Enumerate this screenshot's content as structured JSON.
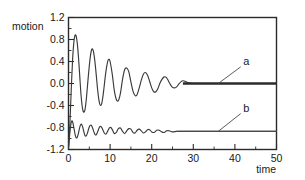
{
  "chart_data": {
    "type": "line",
    "title": "",
    "xlabel": "time",
    "ylabel": "motion",
    "xlim": [
      0,
      50
    ],
    "ylim": [
      -1.2,
      1.2
    ],
    "grid": false,
    "legend_position": "inline-annotations",
    "x_ticks": [
      0,
      10,
      20,
      30,
      40,
      50
    ],
    "x_tick_labels": [
      "0",
      "10",
      "20",
      "30",
      "40",
      "50"
    ],
    "x_minor_ticks": [
      5,
      15,
      25,
      35,
      45
    ],
    "y_ticks": [
      1.2,
      0.8,
      0.4,
      0.0,
      -0.4,
      -0.8,
      -1.2
    ],
    "y_tick_labels": [
      "1.2",
      "0.8",
      "0.4",
      "0.0",
      "-0.4",
      "-0.8",
      "-1.2"
    ],
    "y_minor_ticks": [
      1.0,
      0.6,
      0.2,
      -0.2,
      -0.6,
      -1.0
    ],
    "annotations": [
      {
        "text": "a",
        "x": 42.0,
        "y": 0.33,
        "points_to_x": 36.0,
        "points_to_y": 0.0
      },
      {
        "text": "b",
        "x": 42.0,
        "y": -0.52,
        "points_to_x": 36.0,
        "points_to_y": -0.87
      }
    ],
    "series": [
      {
        "name": "a",
        "label": "a",
        "steady_state": 0.0,
        "description": "underdamped oscillation settling to 0.0",
        "x": [
          0.0,
          0.25,
          0.5,
          0.75,
          1.0,
          1.25,
          1.5,
          1.75,
          2.0,
          2.25,
          2.5,
          2.75,
          3.0,
          3.25,
          3.5,
          3.75,
          4.0,
          4.25,
          4.5,
          4.75,
          5.0,
          5.25,
          5.5,
          5.75,
          6.0,
          6.25,
          6.5,
          6.75,
          7.0,
          7.25,
          7.5,
          7.75,
          8.0,
          8.25,
          8.5,
          8.75,
          9.0,
          9.25,
          9.5,
          9.75,
          10.0,
          10.5,
          11.0,
          11.5,
          12.0,
          12.5,
          13.0,
          13.5,
          14.0,
          14.5,
          15.0,
          15.5,
          16.0,
          16.5,
          17.0,
          17.5,
          18.0,
          18.5,
          19.0,
          19.5,
          20.0,
          20.5,
          21.0,
          21.5,
          22.0,
          22.5,
          23.0,
          23.5,
          24.0,
          24.5,
          25.0,
          25.5,
          26.0,
          26.5,
          27.0,
          27.5,
          28.0,
          29.0,
          31.0,
          34.0,
          38.0,
          44.0,
          50.0
        ],
        "y": [
          -1.18,
          -0.88,
          -0.42,
          0.05,
          0.46,
          0.72,
          0.86,
          0.88,
          0.8,
          0.62,
          0.37,
          0.08,
          -0.2,
          -0.39,
          -0.5,
          -0.52,
          -0.46,
          -0.31,
          -0.1,
          0.12,
          0.32,
          0.49,
          0.6,
          0.63,
          0.58,
          0.46,
          0.29,
          0.09,
          -0.11,
          -0.27,
          -0.37,
          -0.4,
          -0.36,
          -0.25,
          -0.1,
          0.07,
          0.22,
          0.34,
          0.42,
          0.44,
          0.4,
          0.18,
          -0.12,
          -0.29,
          -0.31,
          -0.17,
          0.08,
          0.25,
          0.28,
          0.21,
          0.03,
          -0.14,
          -0.22,
          -0.2,
          -0.08,
          0.06,
          0.17,
          0.2,
          0.15,
          0.04,
          -0.08,
          -0.15,
          -0.15,
          -0.09,
          0.01,
          0.08,
          0.12,
          0.11,
          0.05,
          -0.02,
          -0.07,
          -0.08,
          -0.06,
          -0.01,
          0.03,
          0.05,
          0.04,
          0.01,
          0.0,
          0.0,
          0.0,
          0.0,
          0.0
        ]
      },
      {
        "name": "b",
        "label": "b",
        "steady_state": -0.87,
        "description": "smaller-amplitude higher-frequency damped oscillation settling to -0.87",
        "x": [
          0.0,
          0.2,
          0.4,
          0.6,
          0.8,
          1.0,
          1.2,
          1.4,
          1.6,
          1.8,
          2.0,
          2.2,
          2.4,
          2.6,
          2.8,
          3.0,
          3.2,
          3.4,
          3.6,
          3.8,
          4.0,
          4.3,
          4.6,
          4.9,
          5.2,
          5.5,
          5.8,
          6.1,
          6.4,
          6.7,
          7.0,
          7.4,
          7.8,
          8.2,
          8.6,
          9.0,
          9.4,
          9.8,
          10.2,
          10.6,
          11.0,
          11.5,
          12.0,
          12.5,
          13.0,
          13.5,
          14.0,
          14.5,
          15.0,
          15.5,
          16.0,
          16.5,
          17.0,
          17.5,
          18.0,
          18.5,
          19.0,
          19.5,
          20.0,
          20.6,
          21.2,
          21.8,
          22.4,
          23.0,
          23.6,
          24.2,
          25.0,
          26.0,
          27.0,
          28.0,
          30.0,
          33.0,
          37.0,
          42.0,
          50.0
        ],
        "y": [
          -1.16,
          -1.0,
          -0.84,
          -0.73,
          -0.68,
          -0.7,
          -0.77,
          -0.85,
          -0.93,
          -0.98,
          -0.99,
          -0.96,
          -0.9,
          -0.83,
          -0.77,
          -0.74,
          -0.75,
          -0.79,
          -0.85,
          -0.91,
          -0.95,
          -0.95,
          -0.89,
          -0.81,
          -0.76,
          -0.76,
          -0.81,
          -0.88,
          -0.93,
          -0.93,
          -0.88,
          -0.8,
          -0.78,
          -0.83,
          -0.9,
          -0.92,
          -0.87,
          -0.81,
          -0.8,
          -0.85,
          -0.91,
          -0.89,
          -0.82,
          -0.81,
          -0.87,
          -0.91,
          -0.86,
          -0.82,
          -0.83,
          -0.89,
          -0.9,
          -0.85,
          -0.83,
          -0.86,
          -0.9,
          -0.88,
          -0.84,
          -0.84,
          -0.88,
          -0.89,
          -0.85,
          -0.85,
          -0.88,
          -0.89,
          -0.86,
          -0.86,
          -0.88,
          -0.87,
          -0.87,
          -0.87,
          -0.87,
          -0.87,
          -0.87,
          -0.87,
          -0.87
        ]
      }
    ]
  },
  "figure": {
    "axis_titles": {
      "y": "motion",
      "x": "time"
    }
  }
}
